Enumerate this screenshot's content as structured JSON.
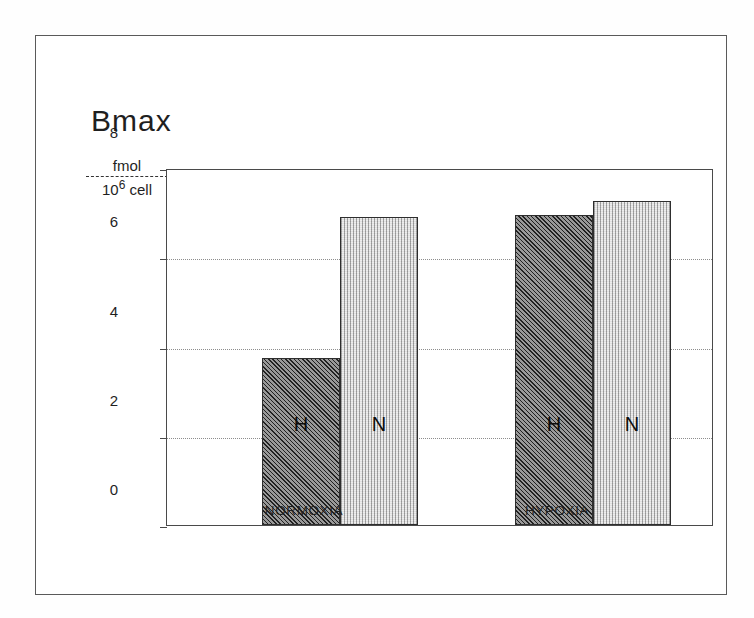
{
  "figure": {
    "title": "Bmax",
    "y_axis_unit": {
      "numerator": "fmol",
      "denominator_base": "10",
      "denominator_exponent": "6",
      "denominator_suffix": "cell"
    }
  },
  "chart_data": {
    "type": "bar",
    "title": "Bmax",
    "xlabel": "",
    "ylabel": "fmol / 10^6 cell",
    "ylim": [
      0,
      8
    ],
    "yticks": [
      "0",
      "2",
      "4",
      "6",
      "8"
    ],
    "grid": "horizontal-dotted",
    "legend": "in-bar-letters",
    "categories": [
      "NORMOXIA",
      "HYPOXIA"
    ],
    "series": [
      {
        "name": "H",
        "label": "H",
        "fill": "dark-hatched",
        "color": "#6d6d6d",
        "values": [
          3.75,
          6.95
        ]
      },
      {
        "name": "N",
        "label": "N",
        "fill": "light-vertical",
        "color": "#cfcfcf",
        "values": [
          6.9,
          7.25
        ]
      }
    ],
    "bars": [
      {
        "group": "NORMOXIA",
        "series": "H",
        "letter": "H",
        "value": 3.75,
        "style": "dark"
      },
      {
        "group": "NORMOXIA",
        "series": "N",
        "letter": "N",
        "value": 6.9,
        "style": "light"
      },
      {
        "group": "HYPOXIA",
        "series": "H",
        "letter": "H",
        "value": 6.95,
        "style": "dark"
      },
      {
        "group": "HYPOXIA",
        "series": "N",
        "letter": "N",
        "value": 7.25,
        "style": "light"
      }
    ]
  }
}
